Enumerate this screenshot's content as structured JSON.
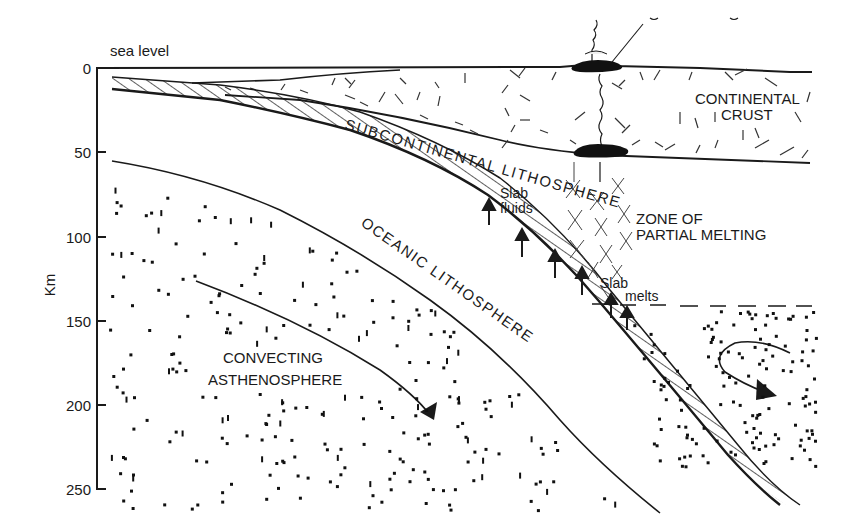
{
  "diagram": {
    "type": "cross-section",
    "colors": {
      "ink": "#1a1a1a",
      "background": "#ffffff"
    }
  },
  "axis": {
    "label": "Km",
    "top_label": "sea level",
    "ticks": [
      "0",
      "50",
      "100",
      "150",
      "200",
      "250"
    ]
  },
  "labels": {
    "continental_crust_line1": "CONTINENTAL",
    "continental_crust_line2": "CRUST",
    "subcontinental_lithosphere": "SUBCONTINENTAL LITHOSPHERE",
    "oceanic_lithosphere": "OCEANIC LITHOSPHERE",
    "zone_line1": "ZONE OF",
    "zone_line2": "PARTIAL MELTING",
    "slab_fluids_line1": "Slab",
    "slab_fluids_line2": "fluids",
    "slab_melts_line1": "Slab",
    "slab_melts_line2": "melts",
    "asthenosphere_line1": "CONVECTING",
    "asthenosphere_line2": "ASTHENOSPHERE"
  },
  "features": {
    "magma_chambers": 2,
    "slab_fluid_arrows": 4,
    "slab_melt_arrows": 2,
    "convection_arrows": 2
  }
}
